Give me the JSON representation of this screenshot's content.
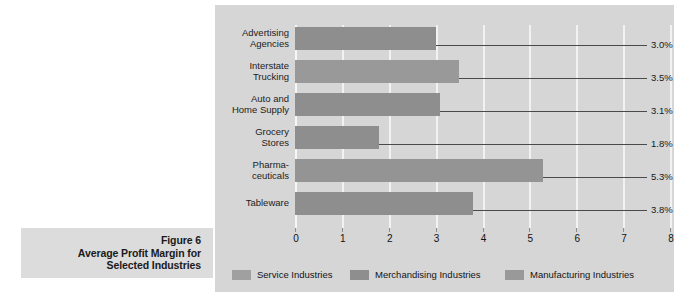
{
  "caption": {
    "figure_label": "Figure 6",
    "title_line1": "Average Profit Margin for",
    "title_line2": "Selected Industries"
  },
  "chart_data": {
    "type": "bar",
    "orientation": "horizontal",
    "title": "Average Profit Margin for Selected Industries",
    "xlabel": "",
    "ylabel": "",
    "xlim": [
      0,
      8
    ],
    "xticks": [
      "0",
      "1",
      "2",
      "3",
      "4",
      "5",
      "6",
      "7",
      "8"
    ],
    "grid": true,
    "categories": [
      "Advertising Agencies",
      "Interstate Trucking",
      "Auto and Home Supply",
      "Grocery Stores",
      "Pharmaceuticals",
      "Tableware"
    ],
    "category_lines": [
      [
        "Advertising",
        "Agencies"
      ],
      [
        "Interstate",
        "Trucking"
      ],
      [
        "Auto and",
        "Home Supply"
      ],
      [
        "Grocery",
        "Stores"
      ],
      [
        "Pharma-",
        "ceuticals"
      ],
      [
        "Tableware"
      ]
    ],
    "values": [
      3.0,
      3.5,
      3.1,
      1.8,
      5.3,
      3.8
    ],
    "value_labels": [
      "3.0%",
      "3.5%",
      "3.1%",
      "1.8%",
      "5.3%",
      "3.8%"
    ],
    "group_of_bar": [
      "Service Industries",
      "Service Industries",
      "Merchandising Industries",
      "Merchandising Industries",
      "Manufacturing Industries",
      "Manufacturing Industries"
    ],
    "bar_colors": [
      "#8e8e8e",
      "#999999",
      "#8e8e8e",
      "#8e8e8e",
      "#949494",
      "#8e8e8e"
    ],
    "legend_position": "bottom",
    "legend": [
      {
        "label": "Service Industries",
        "color": "#a0a0a0"
      },
      {
        "label": "Merchandising Industries",
        "color": "#8e8e8e"
      },
      {
        "label": "Manufacturing Industries",
        "color": "#999999"
      }
    ]
  },
  "colors": {
    "panel_background": "#d6d6d6",
    "caption_background": "#dcdcdc",
    "gridline": "#f2f2f2",
    "leader_line": "#4a4a4a",
    "text": "#161616"
  }
}
